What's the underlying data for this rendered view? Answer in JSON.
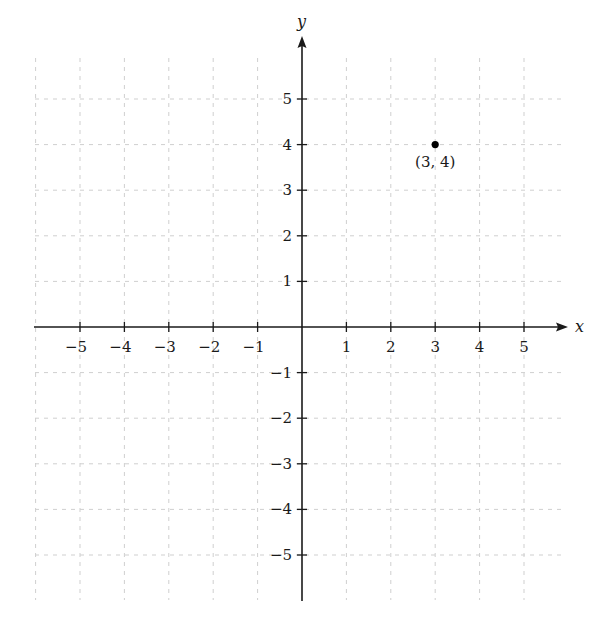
{
  "chart_data": {
    "type": "scatter",
    "title": "",
    "xlabel": "x",
    "ylabel": "y",
    "xlim": [
      -5,
      5
    ],
    "ylim": [
      -5,
      5
    ],
    "grid": true,
    "grid_style": "dashed",
    "x_ticks": [
      -5,
      -4,
      -3,
      -2,
      -1,
      1,
      2,
      3,
      4,
      5
    ],
    "y_ticks": [
      -5,
      -4,
      -3,
      -2,
      -1,
      1,
      2,
      3,
      4,
      5
    ],
    "x_tick_labels": [
      "−5",
      "−4",
      "−3",
      "−2",
      "−1",
      "1",
      "2",
      "3",
      "4",
      "5"
    ],
    "y_tick_labels": [
      "−5",
      "−4",
      "−3",
      "−2",
      "−1",
      "1",
      "2",
      "3",
      "4",
      "5"
    ],
    "series": [
      {
        "name": "point",
        "points": [
          {
            "x": 3,
            "y": 4,
            "label": "(3, 4)"
          }
        ]
      }
    ],
    "legend": null
  },
  "colors": {
    "axis": "#1a1a1a",
    "grid": "#cfcfcf",
    "point": "#000000"
  }
}
